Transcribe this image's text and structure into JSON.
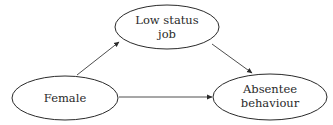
{
  "diagram": {
    "type": "path-diagram",
    "nodes": [
      {
        "id": "low_status_job",
        "line1": "Low status",
        "line2": "job"
      },
      {
        "id": "female",
        "line1": "Female"
      },
      {
        "id": "absentee_behaviour",
        "line1": "Absentee",
        "line2": "behaviour"
      }
    ],
    "edges": [
      {
        "from": "female",
        "to": "low_status_job"
      },
      {
        "from": "low_status_job",
        "to": "absentee_behaviour"
      },
      {
        "from": "female",
        "to": "absentee_behaviour"
      }
    ],
    "colors": {
      "stroke": "#2a2a2a",
      "text": "#2a2a2a",
      "background": "#ffffff"
    }
  }
}
